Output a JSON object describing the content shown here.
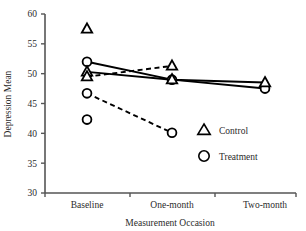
{
  "chart_data": {
    "type": "line",
    "title": "",
    "xlabel": "Measurement Occasion",
    "ylabel": "Depression Mean",
    "categories": [
      "Baseline",
      "One-month",
      "Two-month"
    ],
    "ylim": [
      30,
      60
    ],
    "yticks": [
      30,
      35,
      40,
      45,
      50,
      55,
      60
    ],
    "ytick_labels": [
      "30",
      "35",
      "40",
      "45",
      "50",
      "55",
      "60"
    ],
    "grid": false,
    "legend_position": "inside-lower-right",
    "legend": [
      {
        "marker": "triangle",
        "label": "Control"
      },
      {
        "marker": "circle",
        "label": "Treatment"
      }
    ],
    "series": [
      {
        "name": "Treatment (solid)",
        "marker": "circle",
        "linestyle": "solid",
        "x": [
          "Baseline",
          "One-month",
          "Two-month"
        ],
        "values": [
          52.0,
          49.0,
          47.5
        ]
      },
      {
        "name": "Control (solid)",
        "marker": "triangle",
        "linestyle": "solid",
        "x": [
          "Baseline",
          "One-month",
          "Two-month"
        ],
        "values": [
          50.3,
          49.0,
          48.5
        ]
      },
      {
        "name": "Control (dashed)",
        "marker": "triangle",
        "linestyle": "dashed",
        "x": [
          "Baseline",
          "One-month"
        ],
        "values": [
          49.5,
          51.3
        ]
      },
      {
        "name": "Treatment (dashed)",
        "marker": "circle",
        "linestyle": "dashed",
        "x": [
          "Baseline",
          "One-month"
        ],
        "values": [
          46.7,
          40.1
        ]
      }
    ],
    "isolated_points": [
      {
        "marker": "triangle",
        "x": "Baseline",
        "value": 57.5
      },
      {
        "marker": "circle",
        "x": "Baseline",
        "value": 42.3
      }
    ]
  },
  "axis": {
    "y_label": "Depression Mean",
    "x_label": "Measurement Occasion",
    "y_ticks": [
      "60",
      "55",
      "50",
      "45",
      "40",
      "35",
      "30"
    ],
    "x_ticks": [
      "Baseline",
      "One-month",
      "Two-month"
    ]
  },
  "legend": {
    "control": "Control",
    "treatment": "Treatment"
  },
  "colors": {
    "line": "#000000",
    "text": "#2b2b2b",
    "axis": "#555555",
    "background": "#ffffff"
  }
}
